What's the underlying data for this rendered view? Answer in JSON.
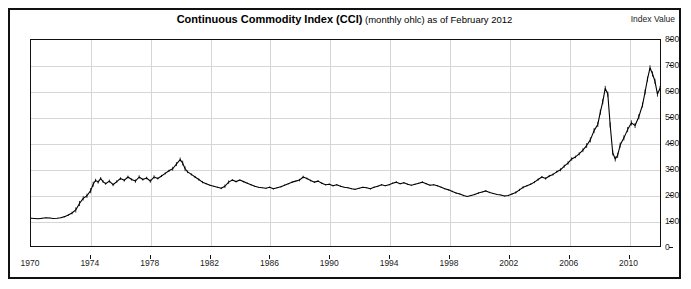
{
  "header": {
    "title_bold": "Continuous Commodity Index  (CCI)",
    "title_rest": " (monthly ohlc) as of February 2012",
    "axis_title": "Index Value"
  },
  "chart_data": {
    "type": "line",
    "title": "Continuous Commodity Index (CCI) (monthly ohlc) as of February 2012",
    "subtitle": "monthly ohlc",
    "as_of": "February 2012",
    "xlabel": "",
    "ylabel": "Index Value",
    "xlim": [
      1970,
      2012.17
    ],
    "ylim": [
      0,
      800
    ],
    "ytick_labels": [
      "0",
      "100",
      "200",
      "300",
      "400",
      "500",
      "600",
      "700",
      "800"
    ],
    "ytick_values": [
      0,
      100,
      200,
      300,
      400,
      500,
      600,
      700,
      800
    ],
    "xtick_labels": [
      "1970",
      "1974",
      "1978",
      "1982",
      "1986",
      "1990",
      "1994",
      "1998",
      "2002",
      "2006",
      "2010"
    ],
    "xtick_values": [
      1970,
      1974,
      1978,
      1982,
      1986,
      1990,
      1994,
      1998,
      2002,
      2006,
      2010
    ],
    "grid": true,
    "legend": "none",
    "line_color": "#000000",
    "series": [
      {
        "name": "Continuous Commodity Index (CCI)",
        "x": [
          1970.0,
          1970.25,
          1970.5,
          1970.75,
          1971.0,
          1971.25,
          1971.5,
          1971.75,
          1972.0,
          1972.25,
          1972.5,
          1972.75,
          1973.0,
          1973.25,
          1973.5,
          1973.75,
          1974.0,
          1974.17,
          1974.33,
          1974.5,
          1974.67,
          1974.83,
          1975.0,
          1975.25,
          1975.5,
          1975.75,
          1976.0,
          1976.25,
          1976.5,
          1976.75,
          1977.0,
          1977.25,
          1977.5,
          1977.75,
          1978.0,
          1978.25,
          1978.5,
          1978.75,
          1979.0,
          1979.25,
          1979.5,
          1979.75,
          1980.0,
          1980.17,
          1980.33,
          1980.5,
          1980.75,
          1981.0,
          1981.25,
          1981.5,
          1981.75,
          1982.0,
          1982.25,
          1982.5,
          1982.75,
          1983.0,
          1983.25,
          1983.5,
          1983.75,
          1984.0,
          1984.25,
          1984.5,
          1984.75,
          1985.0,
          1985.25,
          1985.5,
          1985.75,
          1986.0,
          1986.25,
          1986.5,
          1986.75,
          1987.0,
          1987.25,
          1987.5,
          1987.75,
          1988.0,
          1988.25,
          1988.5,
          1988.75,
          1989.0,
          1989.25,
          1989.5,
          1989.75,
          1990.0,
          1990.25,
          1990.5,
          1990.75,
          1991.0,
          1991.25,
          1991.5,
          1991.75,
          1992.0,
          1992.25,
          1992.5,
          1992.75,
          1993.0,
          1993.25,
          1993.5,
          1993.75,
          1994.0,
          1994.25,
          1994.5,
          1994.75,
          1995.0,
          1995.25,
          1995.5,
          1995.75,
          1996.0,
          1996.25,
          1996.5,
          1996.75,
          1997.0,
          1997.25,
          1997.5,
          1997.75,
          1998.0,
          1998.25,
          1998.5,
          1998.75,
          1999.0,
          1999.25,
          1999.5,
          1999.75,
          2000.0,
          2000.25,
          2000.5,
          2000.75,
          2001.0,
          2001.25,
          2001.5,
          2001.75,
          2002.0,
          2002.25,
          2002.5,
          2002.75,
          2003.0,
          2003.25,
          2003.5,
          2003.75,
          2004.0,
          2004.25,
          2004.5,
          2004.75,
          2005.0,
          2005.25,
          2005.5,
          2005.75,
          2006.0,
          2006.25,
          2006.5,
          2006.75,
          2007.0,
          2007.25,
          2007.5,
          2007.75,
          2008.0,
          2008.17,
          2008.33,
          2008.5,
          2008.67,
          2008.83,
          2009.0,
          2009.17,
          2009.33,
          2009.5,
          2009.75,
          2010.0,
          2010.25,
          2010.5,
          2010.75,
          2011.0,
          2011.17,
          2011.33,
          2011.5,
          2011.67,
          2011.83,
          2012.0,
          2012.17
        ],
        "y": [
          108,
          107,
          106,
          108,
          110,
          109,
          107,
          108,
          110,
          114,
          120,
          128,
          140,
          165,
          185,
          195,
          215,
          240,
          255,
          248,
          262,
          250,
          242,
          252,
          238,
          250,
          262,
          255,
          268,
          258,
          252,
          268,
          258,
          264,
          252,
          268,
          262,
          272,
          282,
          292,
          300,
          318,
          336,
          322,
          300,
          288,
          278,
          268,
          258,
          248,
          242,
          236,
          232,
          228,
          224,
          232,
          248,
          256,
          250,
          256,
          250,
          244,
          238,
          232,
          228,
          226,
          224,
          228,
          222,
          226,
          230,
          236,
          242,
          248,
          252,
          256,
          268,
          262,
          254,
          248,
          252,
          244,
          238,
          240,
          234,
          238,
          232,
          228,
          226,
          222,
          220,
          224,
          228,
          226,
          222,
          228,
          232,
          238,
          234,
          238,
          244,
          248,
          242,
          246,
          240,
          236,
          240,
          244,
          248,
          242,
          236,
          238,
          234,
          228,
          222,
          218,
          212,
          206,
          202,
          196,
          192,
          196,
          200,
          206,
          210,
          214,
          208,
          204,
          200,
          198,
          194,
          196,
          202,
          208,
          218,
          228,
          234,
          240,
          248,
          258,
          268,
          262,
          272,
          278,
          288,
          296,
          310,
          322,
          338,
          346,
          358,
          372,
          390,
          412,
          448,
          472,
          520,
          560,
          612,
          590,
          470,
          362,
          338,
          352,
          392,
          420,
          452,
          478,
          468,
          502,
          548,
          598,
          648,
          692,
          668,
          640,
          590,
          612
        ]
      }
    ],
    "annotations": {
      "peak_1980": {
        "year": 1980.0,
        "value": 336
      },
      "peak_2008": {
        "year": 2008.5,
        "value": 612
      },
      "trough_2009": {
        "year": 2009.17,
        "value": 338
      },
      "peak_2011": {
        "year": 2011.5,
        "value": 692
      },
      "last_value": 612
    }
  }
}
